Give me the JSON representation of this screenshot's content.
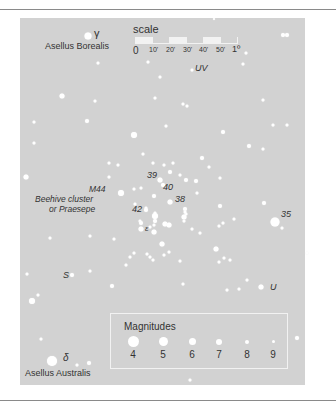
{
  "chart_data": {
    "type": "scatter",
    "background_color": "#d2d2d2",
    "star_color": "#ffffff",
    "labels": {
      "gamma": "γ",
      "asellus_borealis": "Asellus Borealis",
      "uv": "UV",
      "m44": "M44",
      "beehive": "Beehive cluster",
      "praesepe": "or Praesepe",
      "n39": "39",
      "n40": "40",
      "n38": "38",
      "n42": "42",
      "epsilon": "ε",
      "n35": "35",
      "s": "S",
      "u": "U",
      "delta": "δ",
      "asellus_australis": "Asellus Australis"
    },
    "scale": {
      "title": "scale",
      "ticks": [
        "0",
        "10'",
        "20'",
        "30'",
        "40'",
        "50'",
        "1º"
      ]
    },
    "legend": {
      "title": "Magnitudes",
      "items": [
        {
          "mag": "4",
          "size": 11
        },
        {
          "mag": "5",
          "size": 9
        },
        {
          "mag": "6",
          "size": 7
        },
        {
          "mag": "7",
          "size": 6
        },
        {
          "mag": "8",
          "size": 4
        },
        {
          "mag": "9",
          "size": 3
        }
      ]
    },
    "stars": [
      {
        "x": 88,
        "y": 36,
        "s": 7
      },
      {
        "x": 214,
        "y": 19,
        "s": 2
      },
      {
        "x": 283,
        "y": 35,
        "s": 4
      },
      {
        "x": 287,
        "y": 35,
        "s": 4
      },
      {
        "x": 246,
        "y": 53,
        "s": 3
      },
      {
        "x": 243,
        "y": 64,
        "s": 3
      },
      {
        "x": 98,
        "y": 63,
        "s": 3
      },
      {
        "x": 148,
        "y": 62,
        "s": 3
      },
      {
        "x": 160,
        "y": 77,
        "s": 3
      },
      {
        "x": 192,
        "y": 70,
        "s": 3
      },
      {
        "x": 62,
        "y": 96,
        "s": 5
      },
      {
        "x": 95,
        "y": 101,
        "s": 3
      },
      {
        "x": 155,
        "y": 98,
        "s": 3
      },
      {
        "x": 183,
        "y": 104,
        "s": 3
      },
      {
        "x": 187,
        "y": 106,
        "s": 3
      },
      {
        "x": 263,
        "y": 100,
        "s": 3
      },
      {
        "x": 34,
        "y": 122,
        "s": 3
      },
      {
        "x": 87,
        "y": 121,
        "s": 4
      },
      {
        "x": 166,
        "y": 126,
        "s": 3
      },
      {
        "x": 273,
        "y": 125,
        "s": 3
      },
      {
        "x": 287,
        "y": 125,
        "s": 3
      },
      {
        "x": 134,
        "y": 135,
        "s": 6
      },
      {
        "x": 223,
        "y": 132,
        "s": 4
      },
      {
        "x": 34,
        "y": 143,
        "s": 3
      },
      {
        "x": 249,
        "y": 146,
        "s": 4
      },
      {
        "x": 263,
        "y": 149,
        "s": 3
      },
      {
        "x": 143,
        "y": 154,
        "s": 3
      },
      {
        "x": 109,
        "y": 163,
        "s": 3
      },
      {
        "x": 118,
        "y": 165,
        "s": 3
      },
      {
        "x": 153,
        "y": 163,
        "s": 3
      },
      {
        "x": 164,
        "y": 165,
        "s": 3
      },
      {
        "x": 173,
        "y": 163,
        "s": 3
      },
      {
        "x": 202,
        "y": 158,
        "s": 4
      },
      {
        "x": 209,
        "y": 167,
        "s": 3
      },
      {
        "x": 26,
        "y": 177,
        "s": 5
      },
      {
        "x": 109,
        "y": 177,
        "s": 3
      },
      {
        "x": 170,
        "y": 172,
        "s": 4
      },
      {
        "x": 180,
        "y": 175,
        "s": 3
      },
      {
        "x": 186,
        "y": 180,
        "s": 4
      },
      {
        "x": 196,
        "y": 181,
        "s": 4
      },
      {
        "x": 160,
        "y": 180,
        "s": 5
      },
      {
        "x": 163,
        "y": 185,
        "s": 4
      },
      {
        "x": 220,
        "y": 178,
        "s": 3
      },
      {
        "x": 134,
        "y": 189,
        "s": 3
      },
      {
        "x": 141,
        "y": 188,
        "s": 3
      },
      {
        "x": 121,
        "y": 193,
        "s": 6
      },
      {
        "x": 154,
        "y": 196,
        "s": 4
      },
      {
        "x": 197,
        "y": 193,
        "s": 3
      },
      {
        "x": 135,
        "y": 204,
        "s": 3
      },
      {
        "x": 170,
        "y": 202,
        "s": 5
      },
      {
        "x": 264,
        "y": 203,
        "s": 4
      },
      {
        "x": 146,
        "y": 208,
        "s": 3
      },
      {
        "x": 185,
        "y": 209,
        "s": 4
      },
      {
        "x": 220,
        "y": 206,
        "s": 4
      },
      {
        "x": 186,
        "y": 214,
        "s": 3
      },
      {
        "x": 146,
        "y": 210,
        "s": 4
      },
      {
        "x": 155,
        "y": 213,
        "s": 3
      },
      {
        "x": 184,
        "y": 217,
        "s": 5
      },
      {
        "x": 155,
        "y": 216,
        "s": 6
      },
      {
        "x": 185,
        "y": 212,
        "s": 3
      },
      {
        "x": 155,
        "y": 221,
        "s": 4
      },
      {
        "x": 140,
        "y": 221,
        "s": 3
      },
      {
        "x": 184,
        "y": 221,
        "s": 3
      },
      {
        "x": 234,
        "y": 219,
        "s": 3
      },
      {
        "x": 141,
        "y": 223,
        "s": 4
      },
      {
        "x": 154,
        "y": 225,
        "s": 3
      },
      {
        "x": 275,
        "y": 222,
        "s": 9
      },
      {
        "x": 223,
        "y": 223,
        "s": 3
      },
      {
        "x": 141,
        "y": 229,
        "s": 5
      },
      {
        "x": 150,
        "y": 227,
        "s": 3
      },
      {
        "x": 165,
        "y": 224,
        "s": 5
      },
      {
        "x": 169,
        "y": 225,
        "s": 5
      },
      {
        "x": 219,
        "y": 226,
        "s": 3
      },
      {
        "x": 282,
        "y": 228,
        "s": 3
      },
      {
        "x": 154,
        "y": 232,
        "s": 5
      },
      {
        "x": 192,
        "y": 229,
        "s": 3
      },
      {
        "x": 200,
        "y": 233,
        "s": 3
      },
      {
        "x": 50,
        "y": 238,
        "s": 3
      },
      {
        "x": 90,
        "y": 236,
        "s": 3
      },
      {
        "x": 114,
        "y": 239,
        "s": 3
      },
      {
        "x": 162,
        "y": 244,
        "s": 5
      },
      {
        "x": 216,
        "y": 249,
        "s": 5
      },
      {
        "x": 307,
        "y": 253,
        "s": 3
      },
      {
        "x": 134,
        "y": 253,
        "s": 3
      },
      {
        "x": 150,
        "y": 257,
        "s": 3
      },
      {
        "x": 130,
        "y": 257,
        "s": 3
      },
      {
        "x": 164,
        "y": 255,
        "s": 3
      },
      {
        "x": 169,
        "y": 252,
        "s": 3
      },
      {
        "x": 147,
        "y": 254,
        "s": 3
      },
      {
        "x": 153,
        "y": 260,
        "s": 3
      },
      {
        "x": 126,
        "y": 265,
        "s": 3
      },
      {
        "x": 180,
        "y": 261,
        "s": 3
      },
      {
        "x": 219,
        "y": 262,
        "s": 3
      },
      {
        "x": 224,
        "y": 258,
        "s": 3
      },
      {
        "x": 230,
        "y": 260,
        "s": 3
      },
      {
        "x": 27,
        "y": 274,
        "s": 3
      },
      {
        "x": 72,
        "y": 275,
        "s": 4
      },
      {
        "x": 90,
        "y": 271,
        "s": 3
      },
      {
        "x": 112,
        "y": 286,
        "s": 4
      },
      {
        "x": 183,
        "y": 284,
        "s": 3
      },
      {
        "x": 227,
        "y": 290,
        "s": 3
      },
      {
        "x": 239,
        "y": 289,
        "s": 3
      },
      {
        "x": 247,
        "y": 280,
        "s": 3
      },
      {
        "x": 261,
        "y": 287,
        "s": 5
      },
      {
        "x": 38,
        "y": 295,
        "s": 3
      },
      {
        "x": 32,
        "y": 301,
        "s": 6
      },
      {
        "x": 41,
        "y": 339,
        "s": 3
      },
      {
        "x": 297,
        "y": 338,
        "s": 4
      },
      {
        "x": 52,
        "y": 361,
        "s": 10
      },
      {
        "x": 77,
        "y": 365,
        "s": 3
      },
      {
        "x": 89,
        "y": 363,
        "s": 4
      },
      {
        "x": 190,
        "y": 380,
        "s": 3
      }
    ]
  }
}
